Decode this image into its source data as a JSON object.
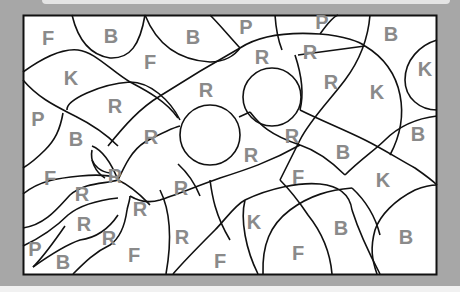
{
  "puzzle": {
    "type": "color-by-letter",
    "legend_letters": [
      "B",
      "F",
      "K",
      "P",
      "R"
    ],
    "regions": [
      {
        "letter": "F",
        "x": 48,
        "y": 38
      },
      {
        "letter": "B",
        "x": 111,
        "y": 36
      },
      {
        "letter": "B",
        "x": 193,
        "y": 37
      },
      {
        "letter": "P",
        "x": 246,
        "y": 27
      },
      {
        "letter": "P",
        "x": 322,
        "y": 22
      },
      {
        "letter": "B",
        "x": 391,
        "y": 34
      },
      {
        "letter": "F",
        "x": 150,
        "y": 62
      },
      {
        "letter": "K",
        "x": 71,
        "y": 78
      },
      {
        "letter": "R",
        "x": 262,
        "y": 57
      },
      {
        "letter": "R",
        "x": 310,
        "y": 52
      },
      {
        "letter": "K",
        "x": 425,
        "y": 69
      },
      {
        "letter": "R",
        "x": 206,
        "y": 90
      },
      {
        "letter": "R",
        "x": 331,
        "y": 82
      },
      {
        "letter": "K",
        "x": 377,
        "y": 92
      },
      {
        "letter": "R",
        "x": 115,
        "y": 106
      },
      {
        "letter": "P",
        "x": 38,
        "y": 119
      },
      {
        "letter": "B",
        "x": 76,
        "y": 139
      },
      {
        "letter": "R",
        "x": 151,
        "y": 137
      },
      {
        "letter": "R",
        "x": 292,
        "y": 136
      },
      {
        "letter": "B",
        "x": 418,
        "y": 134
      },
      {
        "letter": "R",
        "x": 251,
        "y": 155
      },
      {
        "letter": "B",
        "x": 343,
        "y": 152
      },
      {
        "letter": "F",
        "x": 50,
        "y": 178
      },
      {
        "letter": "R",
        "x": 115,
        "y": 176
      },
      {
        "letter": "F",
        "x": 298,
        "y": 177
      },
      {
        "letter": "K",
        "x": 383,
        "y": 180
      },
      {
        "letter": "R",
        "x": 82,
        "y": 194
      },
      {
        "letter": "R",
        "x": 181,
        "y": 188
      },
      {
        "letter": "R",
        "x": 140,
        "y": 209
      },
      {
        "letter": "R",
        "x": 84,
        "y": 224
      },
      {
        "letter": "K",
        "x": 254,
        "y": 222
      },
      {
        "letter": "R",
        "x": 109,
        "y": 238
      },
      {
        "letter": "R",
        "x": 182,
        "y": 237
      },
      {
        "letter": "B",
        "x": 341,
        "y": 228
      },
      {
        "letter": "B",
        "x": 406,
        "y": 237
      },
      {
        "letter": "P",
        "x": 35,
        "y": 249
      },
      {
        "letter": "B",
        "x": 63,
        "y": 262
      },
      {
        "letter": "F",
        "x": 134,
        "y": 255
      },
      {
        "letter": "F",
        "x": 220,
        "y": 261
      },
      {
        "letter": "F",
        "x": 298,
        "y": 253
      }
    ]
  },
  "colors": {
    "background": "#a7a7a7",
    "board": "#ffffff",
    "outline": "#111111",
    "letter": "#8a8a8a"
  }
}
